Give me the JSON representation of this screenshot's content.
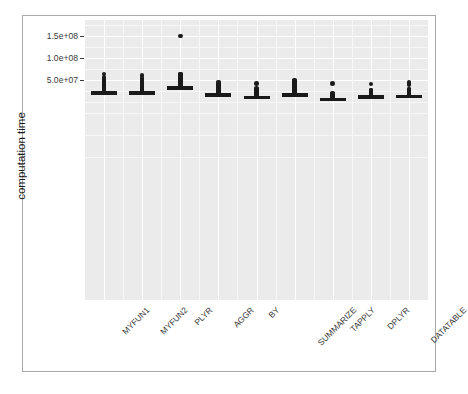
{
  "chart_data": {
    "type": "box",
    "title": "",
    "xlabel": "",
    "ylabel": "computation time",
    "grid": true,
    "legend": "none",
    "ylim": [
      0,
      165000000
    ],
    "ytick_labels": [
      "1.5e+08",
      "1.0e+08",
      "5.0e+07"
    ],
    "ytick_values": [
      150000000,
      100000000,
      50000000
    ],
    "categories": [
      "MYFUN1",
      "MYFUN2",
      "PLYR",
      "AGGR",
      "BY",
      "SUMMARIZE",
      "TAPPLY",
      "DPLYR",
      "DATATABLE"
    ],
    "series": [
      {
        "name": "MYFUN1",
        "median": 22000000,
        "q1": 21000000,
        "q3": 23500000,
        "whisker_low": 20000000,
        "whisker_high": 24500000,
        "outliers": [
          25500000,
          27000000,
          28500000,
          29500000,
          30500000,
          32000000,
          33500000,
          35000000,
          36500000,
          38000000,
          39500000,
          41000000,
          42500000,
          44000000,
          46000000,
          48000000,
          50000000,
          52000000,
          56000000,
          64000000
        ]
      },
      {
        "name": "MYFUN2",
        "median": 22000000,
        "q1": 21000000,
        "q3": 23500000,
        "whisker_low": 20000000,
        "whisker_high": 24500000,
        "outliers": [
          25500000,
          27000000,
          28500000,
          29500000,
          30500000,
          32000000,
          33500000,
          35000000,
          36500000,
          38000000,
          39500000,
          41000000,
          42500000,
          44000000,
          46000000,
          48000000,
          50000000,
          54000000,
          60000000
        ]
      },
      {
        "name": "PLYR",
        "median": 34000000,
        "q1": 33000000,
        "q3": 35500000,
        "whisker_low": 32000000,
        "whisker_high": 36500000,
        "outliers": [
          38000000,
          40000000,
          42000000,
          44000000,
          46000000,
          48000000,
          50000000,
          52000000,
          54000000,
          56000000,
          58000000,
          60000000,
          62000000,
          64000000,
          150000000
        ]
      },
      {
        "name": "AGGR",
        "median": 18500000,
        "q1": 17500000,
        "q3": 19500000,
        "whisker_low": 16500000,
        "whisker_high": 20500000,
        "outliers": [
          22000000,
          23500000,
          25000000,
          26500000,
          28000000,
          29500000,
          31000000,
          33000000,
          35000000,
          37000000,
          39000000,
          41000000,
          43000000,
          45000000
        ]
      },
      {
        "name": "BY",
        "median": 12500000,
        "q1": 11800000,
        "q3": 13500000,
        "whisker_low": 11000000,
        "whisker_high": 14500000,
        "outliers": [
          16000000,
          17500000,
          19000000,
          20500000,
          22000000,
          23500000,
          25000000,
          26500000,
          28000000,
          29500000,
          31000000,
          42000000
        ]
      },
      {
        "name": "SUMMARIZE",
        "median": 18500000,
        "q1": 17500000,
        "q3": 19500000,
        "whisker_low": 16500000,
        "whisker_high": 21000000,
        "outliers": [
          23000000,
          24500000,
          26000000,
          27500000,
          29000000,
          30500000,
          32000000,
          34000000,
          36000000,
          38000000,
          40000000,
          42000000,
          44000000,
          46000000,
          48000000,
          50000000
        ]
      },
      {
        "name": "TAPPLY",
        "median": 8000000,
        "q1": 7400000,
        "q3": 8700000,
        "whisker_low": 7000000,
        "whisker_high": 9500000,
        "outliers": [
          11000000,
          12500000,
          14000000,
          15500000,
          17000000,
          18500000,
          20000000,
          42000000
        ]
      },
      {
        "name": "DPLYR",
        "median": 13500000,
        "q1": 12800000,
        "q3": 14500000,
        "whisker_low": 11800000,
        "whisker_high": 15500000,
        "outliers": [
          17000000,
          18500000,
          20000000,
          21500000,
          23000000,
          24500000,
          26000000,
          27500000,
          41000000
        ]
      },
      {
        "name": "DATATABLE",
        "median": 14500000,
        "q1": 13800000,
        "q3": 15500000,
        "whisker_low": 12800000,
        "whisker_high": 16500000,
        "outliers": [
          18000000,
          19500000,
          21000000,
          22500000,
          24000000,
          25500000,
          27000000,
          28500000,
          30000000,
          40000000,
          44000000
        ]
      }
    ]
  },
  "style": {
    "panel_fill": "#ebebeb",
    "grid_major": "#ffffff",
    "grid_minor": "#f7f7f7",
    "ink": "#1a1a1a",
    "frame": "#a9a9a9",
    "page_bg": "#ffffff"
  }
}
